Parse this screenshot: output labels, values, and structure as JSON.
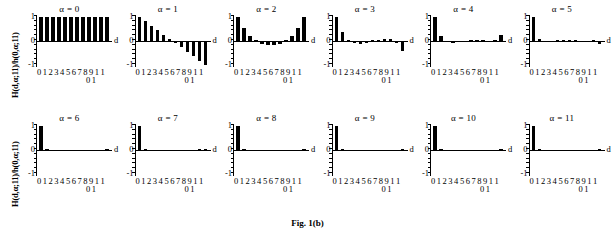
{
  "figure": {
    "caption": "Fig. 1(b)",
    "ylabel": "H(d,α;11)/h(0,α;11)",
    "xlabel": "d",
    "yticks": [
      "1",
      "0",
      "-1"
    ],
    "xticks_row1": "0 1 2 3 4 5 6 7 8 9 1 1",
    "xticks_row2": "0 1"
  },
  "chart_data": {
    "type": "bar",
    "title": "Fig. 1(b)",
    "xlabel": "d",
    "ylabel": "H(d,α;11)/h(0,α;11)",
    "ylim": [
      -1,
      1
    ],
    "grid": false,
    "legend": "none",
    "categories": [
      0,
      1,
      2,
      3,
      4,
      5,
      6,
      7,
      8,
      9,
      10,
      11
    ],
    "panel_layout": {
      "rows": 2,
      "cols": 6
    },
    "panels": [
      {
        "label": "α = 0",
        "alpha": 0,
        "values": [
          1.0,
          1.0,
          1.0,
          1.0,
          1.0,
          1.0,
          1.0,
          1.0,
          1.0,
          1.0,
          1.0,
          1.0
        ]
      },
      {
        "label": "α = 1",
        "alpha": 1,
        "values": [
          1.0,
          0.82,
          0.64,
          0.45,
          0.27,
          0.09,
          -0.09,
          -0.27,
          -0.45,
          -0.64,
          -0.82,
          -1.0
        ]
      },
      {
        "label": "α = 2",
        "alpha": 2,
        "values": [
          1.0,
          0.56,
          0.22,
          0.0,
          -0.12,
          -0.16,
          -0.16,
          -0.12,
          0.0,
          0.22,
          0.56,
          1.0
        ]
      },
      {
        "label": "α = 3",
        "alpha": 3,
        "values": [
          1.0,
          0.36,
          0.03,
          -0.1,
          -0.12,
          -0.08,
          0.0,
          0.06,
          0.1,
          0.07,
          -0.1,
          -0.4
        ]
      },
      {
        "label": "α = 4",
        "alpha": 4,
        "values": [
          1.0,
          0.2,
          -0.04,
          -0.08,
          -0.05,
          -0.01,
          0.02,
          0.03,
          0.01,
          -0.03,
          0.05,
          0.25
        ]
      },
      {
        "label": "α = 5",
        "alpha": 5,
        "values": [
          1.0,
          0.1,
          -0.03,
          -0.02,
          0.0,
          0.01,
          0.01,
          0.0,
          -0.01,
          -0.01,
          0.0,
          -0.12
        ]
      },
      {
        "label": "α = 6",
        "alpha": 6,
        "values": [
          1.0,
          0.06,
          -0.04,
          -0.02,
          -0.01,
          -0.01,
          -0.01,
          -0.01,
          -0.01,
          -0.01,
          -0.01,
          0.06
        ]
      },
      {
        "label": "α = 7",
        "alpha": 7,
        "values": [
          1.0,
          0.02,
          -0.02,
          -0.01,
          -0.01,
          -0.01,
          -0.01,
          -0.01,
          -0.01,
          -0.01,
          0.0,
          0.03
        ]
      },
      {
        "label": "α = 8",
        "alpha": 8,
        "values": [
          1.0,
          0.01,
          -0.02,
          -0.01,
          -0.01,
          -0.01,
          -0.01,
          -0.01,
          -0.01,
          -0.01,
          -0.01,
          0.01
        ]
      },
      {
        "label": "α = 9",
        "alpha": 9,
        "values": [
          1.0,
          0.0,
          -0.01,
          -0.01,
          -0.01,
          -0.01,
          -0.01,
          -0.01,
          -0.01,
          -0.01,
          -0.01,
          0.0
        ]
      },
      {
        "label": "α = 10",
        "alpha": 10,
        "values": [
          1.0,
          0.0,
          -0.01,
          -0.01,
          -0.01,
          -0.01,
          -0.01,
          -0.01,
          -0.01,
          -0.01,
          -0.01,
          0.0
        ]
      },
      {
        "label": "α = 11",
        "alpha": 11,
        "values": [
          1.0,
          0.0,
          -0.01,
          -0.01,
          -0.01,
          -0.01,
          -0.01,
          -0.01,
          -0.01,
          -0.01,
          -0.01,
          0.0
        ]
      }
    ]
  }
}
